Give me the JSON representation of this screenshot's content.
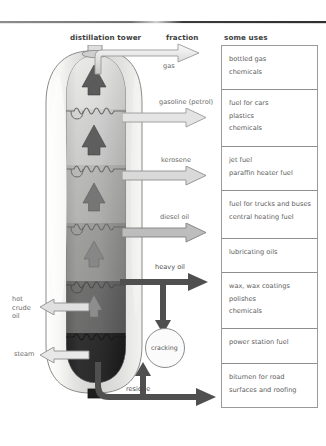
{
  "headers": {
    "tower": "distillation tower",
    "fraction": "fraction",
    "uses": "some uses"
  },
  "fractions": [
    {
      "label": "gas",
      "arrow": "outline"
    },
    {
      "label": "gasoline (petrol)",
      "arrow": "outline"
    },
    {
      "label": "kerosene",
      "arrow": "outline"
    },
    {
      "label": "diesel oil",
      "arrow": "outline"
    },
    {
      "label": "heavy oil",
      "arrow": "solid"
    },
    {
      "label": "residue",
      "arrow": "solid"
    }
  ],
  "inlets": [
    {
      "label_lines": [
        "hot",
        "crude",
        "oil"
      ]
    },
    {
      "label_lines": [
        "steam"
      ]
    }
  ],
  "process": {
    "cracking_label": "cracking"
  },
  "uses": [
    {
      "items": [
        "bottled gas",
        "chemicals"
      ]
    },
    {
      "items": [
        "fuel for cars",
        "plastics",
        "chemicals"
      ]
    },
    {
      "items": [
        "jet fuel",
        "paraffin heater fuel"
      ]
    },
    {
      "items": [
        "fuel for trucks and buses",
        "central heating fuel"
      ]
    },
    {
      "items": [
        "lubricating oils"
      ]
    },
    {
      "items": [
        "wax, wax coatings",
        "polishes",
        "chemicals"
      ]
    },
    {
      "items": [
        "power station fuel"
      ]
    },
    {
      "items": [
        "bitumen for road",
        "surfaces and roofing"
      ]
    }
  ],
  "colors": {
    "band_1": "#d8d8d6",
    "band_2": "#c8c8c6",
    "band_3": "#b4b4b2",
    "band_4": "#9e9e9c",
    "band_5": "#6f6f6f",
    "band_6": "#2a2a2a",
    "shell_edge": "#8f8f8f",
    "arrow_solid": "#555555",
    "arrow_outline_fill": "#e6e6e6",
    "rule": "#6f6f6f"
  }
}
